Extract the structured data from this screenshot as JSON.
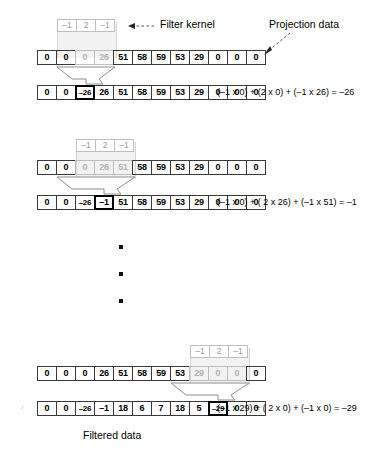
{
  "figure": {
    "caption": "Filtered data",
    "labels": {
      "filter_kernel": "Filter kernel",
      "projection_data": "Projection data"
    }
  },
  "kernel": {
    "values": [
      "–1",
      "2",
      "–1"
    ]
  },
  "blocks": [
    {
      "id": "step-1",
      "kernel_offset_cells": 1,
      "input": {
        "values": [
          "0",
          "0",
          "0",
          "26",
          "51",
          "58",
          "59",
          "53",
          "29",
          "0",
          "0",
          "0"
        ],
        "dimmed_indices": [
          2,
          3
        ]
      },
      "output": {
        "values": [
          "0",
          "0",
          "–26",
          "26",
          "51",
          "58",
          "59",
          "53",
          "29",
          "0",
          "0",
          "0"
        ],
        "highlight_index": 2
      },
      "equation": "(–1 x 0) + (2 x 0) + (–1 x 26) = –26"
    },
    {
      "id": "step-2",
      "kernel_offset_cells": 2,
      "input": {
        "values": [
          "0",
          "0",
          "0",
          "26",
          "51",
          "58",
          "59",
          "53",
          "29",
          "0",
          "0",
          "0"
        ],
        "dimmed_indices": [
          2,
          3,
          4
        ]
      },
      "output": {
        "values": [
          "0",
          "0",
          "–26",
          "–1",
          "51",
          "58",
          "59",
          "53",
          "29",
          "0",
          "0",
          "0"
        ],
        "highlight_index": 3
      },
      "equation": "(–1 x 0) + ( 2 x 26) + (–1 x 51) = –1"
    },
    {
      "id": "step-n",
      "kernel_offset_cells": 8,
      "input": {
        "values": [
          "0",
          "0",
          "0",
          "26",
          "51",
          "58",
          "59",
          "53",
          "29",
          "0",
          "0",
          "0"
        ],
        "dimmed_indices": [
          8,
          9,
          10
        ]
      },
      "output": {
        "values": [
          "0",
          "0",
          "–26",
          "–1",
          "18",
          "6",
          "7",
          "18",
          "5",
          "–29",
          "0",
          "0"
        ],
        "highlight_index": 9
      },
      "equation": "(–1 x 29) + ( 2 x 0) + (–1 x 0) = –29"
    }
  ],
  "ellipsis": {
    "dots": 3
  }
}
